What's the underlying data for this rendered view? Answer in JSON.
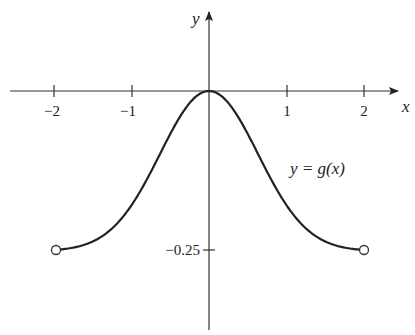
{
  "chart_data": {
    "type": "line",
    "title": "",
    "xlabel": "x",
    "ylabel": "y",
    "curve_label": "y = g(x)",
    "x_ticks": [
      {
        "value": -2,
        "label": "−2"
      },
      {
        "value": -1,
        "label": "−1"
      },
      {
        "value": 1,
        "label": "1"
      },
      {
        "value": 2,
        "label": "2"
      }
    ],
    "y_ticks": [
      {
        "value": -0.25,
        "label": "−0.25"
      }
    ],
    "xlim": [
      -2.5,
      2.6
    ],
    "ylim": [
      -0.37,
      0.14
    ],
    "grid": false,
    "series": [
      {
        "name": "g(x)",
        "x": [
          -2,
          -1.5,
          -1,
          -0.75,
          -0.5,
          -0.25,
          0,
          0.25,
          0.5,
          0.75,
          1,
          1.5,
          2
        ],
        "y": [
          -0.25,
          -0.235,
          -0.18,
          -0.125,
          -0.067,
          -0.019,
          0,
          -0.019,
          -0.067,
          -0.125,
          -0.18,
          -0.235,
          -0.25
        ]
      }
    ],
    "annotations": [
      {
        "type": "open-circle",
        "x": -2,
        "y": -0.25
      },
      {
        "type": "open-circle",
        "x": 2,
        "y": -0.25
      }
    ]
  },
  "labels": {
    "x_axis": "x",
    "y_axis": "y",
    "curve": "y = g(x)",
    "tick_neg2": "−2",
    "tick_neg1": "−1",
    "tick_1": "1",
    "tick_2": "2",
    "tick_y": "−0.25"
  }
}
